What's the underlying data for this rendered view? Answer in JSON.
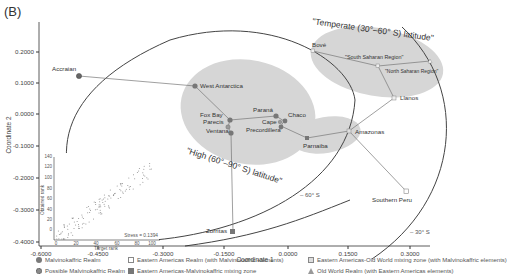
{
  "panel_label": "(B)",
  "chart_data": {
    "type": "scatter",
    "title": "",
    "xlabel": "Coordinate 1",
    "ylabel": "Coordinate 2",
    "xlim": [
      -0.6,
      0.33
    ],
    "ylim": [
      -0.4,
      0.28
    ],
    "x_ticks": [
      "-0.6000",
      "-0.4500",
      "-0.3000",
      "-0.1500",
      "0.0000",
      "0.1500",
      "0.3000"
    ],
    "y_ticks": [
      "0.2000",
      "0.1000",
      "0.0000",
      "-0.1000",
      "-0.2000",
      "-0.3000",
      "-0.4000"
    ],
    "grid": false,
    "points": [
      {
        "name": "Accraian",
        "x": -0.495,
        "y": 0.115,
        "group": "Possible Malvinokaffric Realm"
      },
      {
        "name": "West Antarctica",
        "x": -0.225,
        "y": 0.085,
        "group": "Malvinokaffric Realm"
      },
      {
        "name": "Fox Bay",
        "x": -0.185,
        "y": -0.005,
        "group": "Malvinokaffric Realm"
      },
      {
        "name": "Parecis",
        "x": -0.195,
        "y": -0.02,
        "group": "Possible Malvinokaffric Realm"
      },
      {
        "name": "Ventana",
        "x": -0.19,
        "y": -0.04,
        "group": "Malvinokaffric Realm"
      },
      {
        "name": "Paraná",
        "x": -0.06,
        "y": 0.01,
        "group": "Malvinokaffric Realm"
      },
      {
        "name": "Chaco",
        "x": -0.035,
        "y": -0.01,
        "group": "Malvinokaffric Realm"
      },
      {
        "name": "Cape",
        "x": -0.05,
        "y": -0.015,
        "group": "Possible Malvinokaffric Realm"
      },
      {
        "name": "Precordillera",
        "x": -0.055,
        "y": -0.03,
        "group": "Malvinokaffric Realm"
      },
      {
        "name": "Parnaiba",
        "x": 0.02,
        "y": -0.05,
        "group": "Eastern Americas-Malvinokaffric mixing zone"
      },
      {
        "name": "Amazonas",
        "x": 0.08,
        "y": -0.035,
        "group": "Eastern Americas-Old World mixing zone (with Malvinokaffric elements)"
      },
      {
        "name": "Zorritas",
        "x": -0.17,
        "y": -0.29,
        "group": "Eastern Americas-Malvinokaffric mixing zone"
      },
      {
        "name": "Bové",
        "x": 0.07,
        "y": 0.225,
        "group": "Eastern Americas-Old World mixing zone (with Malvinokaffric elements)"
      },
      {
        "name": "\"South Saharan Region\"",
        "x": 0.16,
        "y": 0.195,
        "group": "Eastern Americas-Old World mixing zone (with Malvinokaffric elements)"
      },
      {
        "name": "\"North Saharan Region\"",
        "x": 0.225,
        "y": 0.18,
        "group": "Old World Realm (with Eastern Americas elements)"
      },
      {
        "name": "Llanos",
        "x": 0.18,
        "y": 0.12,
        "group": "Eastern Americas-Old World mixing zone (with Malvinokaffric elements)"
      },
      {
        "name": "Southern Peru",
        "x": 0.265,
        "y": -0.175,
        "group": "Eastern Americas Realm (with Malvinokaffric elements)"
      }
    ],
    "annotations": [
      "\"Temperate (30°–60° S) latitude\"",
      "\"High (60°–90° S) latitude\"",
      "– 60° S",
      "– 30° S"
    ],
    "inset": {
      "type": "scatter",
      "xlabel": "Target rank",
      "ylabel": "Obtained rank",
      "x_ticks": [
        "0",
        "20",
        "40",
        "60",
        "80",
        "100",
        "120"
      ],
      "y_ticks": [
        "0",
        "20",
        "40",
        "60",
        "80",
        "100",
        "120",
        "140"
      ],
      "annotation": "Stress = 0.1394"
    },
    "legend": [
      {
        "label": "Malvinokaffric Realm",
        "marker": "filled-circle",
        "color": "#7a7a7a"
      },
      {
        "label": "Possible Malvinokaffric Realm",
        "marker": "hatched-circle",
        "color": "#8a8a8a"
      },
      {
        "label": "Eastern Americas Realm (with Malvinokaffric elements)",
        "marker": "open-square",
        "color": "#999999"
      },
      {
        "label": "Eastern Americas-Malvinokaffric mixing zone",
        "marker": "filled-square",
        "color": "#777777"
      },
      {
        "label": "Eastern Americas-Old World mixing zone (with Malvinokaffric elements)",
        "marker": "hatched-square",
        "color": "#aaaaaa"
      },
      {
        "label": "Old World Realm (with Eastern Americas elements)",
        "marker": "triangle",
        "color": "#999999"
      }
    ],
    "legend_position": "bottom"
  }
}
